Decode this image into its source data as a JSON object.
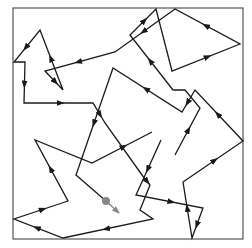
{
  "diagram": {
    "type": "turtle-path",
    "width": 252,
    "height": 248,
    "frame": {
      "x": 13,
      "y": 8,
      "width": 230,
      "height": 231,
      "color": "#555555"
    },
    "line_color": "#1a1a1a",
    "paths": [
      {
        "name": "path-a",
        "points": [
          [
            175,
            155
          ],
          [
            200,
            108
          ],
          [
            185,
            90
          ],
          [
            173,
            90
          ],
          [
            130,
            35
          ],
          [
            156,
            9
          ],
          [
            172,
            71
          ],
          [
            240,
            44
          ],
          [
            175,
            9
          ],
          [
            115,
            52
          ],
          [
            45,
            71
          ],
          [
            63,
            90
          ],
          [
            40,
            30
          ],
          [
            14,
            62
          ],
          [
            25,
            62
          ],
          [
            24,
            103
          ],
          [
            93,
            103
          ],
          [
            105,
            123
          ],
          [
            142,
            175
          ],
          [
            150,
            185
          ],
          [
            140,
            210
          ],
          [
            153,
            219
          ],
          [
            63,
            238
          ],
          [
            14,
            219
          ],
          [
            68,
            201
          ],
          [
            35,
            140
          ],
          [
            92,
            163
          ],
          [
            152,
            132
          ]
        ],
        "arrow_segments": [
          0,
          3,
          4,
          6,
          7,
          8,
          9,
          10,
          11,
          12,
          14,
          15,
          16,
          18,
          21,
          22,
          23,
          24,
          26
        ]
      },
      {
        "name": "path-b",
        "points": [
          [
            161,
            140
          ],
          [
            136,
            195
          ],
          [
            203,
            208
          ],
          [
            192,
            238
          ],
          [
            183,
            182
          ],
          [
            243,
            141
          ],
          [
            195,
            90
          ],
          [
            182,
            112
          ],
          [
            113,
            68
          ],
          [
            76,
            175
          ],
          [
            106,
            201
          ]
        ],
        "arrow_segments": [
          0,
          1,
          2,
          3,
          4,
          5,
          6,
          7,
          8
        ]
      }
    ],
    "turtle": {
      "x": 106,
      "y": 201,
      "radius": 4,
      "color": "#888888",
      "heading_to": [
        119,
        213
      ]
    }
  }
}
